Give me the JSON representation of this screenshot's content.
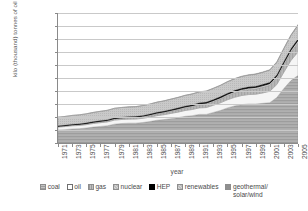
{
  "chart_data": {
    "type": "area",
    "stacked": true,
    "title": "",
    "xlabel": "year",
    "ylabel": "kilo (thousand) tonnes of oil equivalent (ktoe)",
    "ylim": [
      0,
      2000000
    ],
    "ytick_labels": [
      "0",
      "200,000",
      "400,000",
      "600,000",
      "800,000",
      "1,000,000",
      "1,200,000",
      "1,400,000",
      "1,600,000",
      "1,800,000",
      "2,000,000"
    ],
    "ytick_values": [
      0,
      200000,
      400000,
      600000,
      800000,
      1000000,
      1200000,
      1400000,
      1600000,
      1800000,
      2000000
    ],
    "xlim": [
      1971,
      2005
    ],
    "xtick_labels": [
      "1971",
      "1973",
      "1975",
      "1977",
      "1979",
      "1981",
      "1983",
      "1985",
      "1987",
      "1989",
      "1991",
      "1993",
      "1995",
      "1997",
      "1999",
      "2001",
      "2003",
      "2005"
    ],
    "xtick_values": [
      1971,
      1973,
      1975,
      1977,
      1979,
      1981,
      1983,
      1985,
      1987,
      1989,
      1991,
      1993,
      1995,
      1997,
      1999,
      2001,
      2003,
      2005
    ],
    "grid": true,
    "legend_position": "bottom",
    "x": [
      1971,
      1972,
      1973,
      1974,
      1975,
      1976,
      1977,
      1978,
      1979,
      1980,
      1981,
      1982,
      1983,
      1984,
      1985,
      1986,
      1987,
      1988,
      1989,
      1990,
      1991,
      1992,
      1993,
      1994,
      1995,
      1996,
      1997,
      1998,
      1999,
      2000,
      2001,
      2002,
      2003,
      2004,
      2005
    ],
    "series": [
      {
        "name": "coal",
        "color": "#a8a8a8",
        "values": [
          200000,
          205000,
          215000,
          220000,
          230000,
          245000,
          255000,
          265000,
          290000,
          300000,
          305000,
          305000,
          315000,
          330000,
          350000,
          360000,
          375000,
          390000,
          410000,
          420000,
          440000,
          440000,
          470000,
          500000,
          540000,
          570000,
          590000,
          600000,
          600000,
          610000,
          620000,
          700000,
          840000,
          960000,
          1040000
        ]
      },
      {
        "name": "oil",
        "color": "#f2f2f2",
        "values": [
          45000,
          48000,
          50000,
          50000,
          52000,
          55000,
          58000,
          60000,
          62000,
          62000,
          62000,
          63000,
          65000,
          68000,
          70000,
          75000,
          80000,
          85000,
          90000,
          95000,
          100000,
          105000,
          110000,
          118000,
          125000,
          132000,
          140000,
          145000,
          150000,
          160000,
          175000,
          200000,
          250000,
          310000,
          360000
        ]
      },
      {
        "name": "gas",
        "color": "#bdbdbd",
        "values": [
          12000,
          13000,
          14000,
          15000,
          16000,
          17000,
          18000,
          19000,
          20000,
          21000,
          22000,
          23000,
          25000,
          27000,
          29000,
          31000,
          34000,
          37000,
          40000,
          43000,
          46000,
          50000,
          54000,
          58000,
          63000,
          68000,
          72000,
          76000,
          80000,
          86000,
          92000,
          100000,
          112000,
          125000,
          140000
        ]
      },
      {
        "name": "nuclear",
        "color": "#d4d4d4",
        "values": [
          2000,
          2200,
          2500,
          3000,
          3500,
          4000,
          4500,
          5000,
          5500,
          6000,
          7000,
          8000,
          9000,
          10000,
          12000,
          13000,
          14000,
          15000,
          16000,
          17000,
          18000,
          19000,
          20000,
          21000,
          22000,
          23000,
          24000,
          25000,
          26000,
          27000,
          28000,
          30000,
          33000,
          36000,
          40000
        ]
      },
      {
        "name": "HEP",
        "color": "#000000",
        "values": [
          8000,
          8200,
          8500,
          8800,
          9000,
          9200,
          9500,
          9800,
          10000,
          10200,
          10500,
          10800,
          11000,
          11500,
          12000,
          12500,
          13000,
          13500,
          14000,
          14500,
          15000,
          15500,
          16000,
          16500,
          17000,
          17500,
          18000,
          18500,
          19000,
          19500,
          20000,
          21000,
          22000,
          23000,
          24000
        ]
      },
      {
        "name": "renewables",
        "color": "#c4c4c4",
        "values": [
          130000,
          132000,
          134000,
          136000,
          138000,
          140000,
          142000,
          144000,
          146000,
          147000,
          148000,
          149000,
          150000,
          152000,
          154000,
          156000,
          158000,
          160000,
          162000,
          164000,
          166000,
          168000,
          170000,
          172000,
          174000,
          176000,
          178000,
          180000,
          182000,
          184000,
          186000,
          190000,
          195000,
          200000,
          206000
        ]
      },
      {
        "name": "geothermal/solar/wind",
        "color": "#8f8f8f",
        "values": [
          800,
          850,
          900,
          950,
          1000,
          1100,
          1200,
          1300,
          1400,
          1500,
          1600,
          1700,
          1800,
          1900,
          2000,
          2200,
          2400,
          2600,
          2800,
          3000,
          3300,
          3600,
          4000,
          4400,
          4800,
          5200,
          5600,
          6000,
          6500,
          7000,
          7500,
          8500,
          9500,
          10500,
          12000
        ]
      }
    ],
    "totals": [
      397800,
      409250,
      424900,
      433750,
      446500,
      471300,
      489200,
      505100,
      534900,
      546700,
      556100,
      558500,
      576800,
      609400,
      649000,
      679700,
      716400,
      753100,
      794800,
      816500,
      850300,
      861100,
      904000,
      965900,
      1045800,
      1112700,
      1167600,
      1195500,
      1213500,
      1273500,
      1349500,
      1529500,
      1841500,
      2154500,
      2334000
    ]
  },
  "legend": {
    "items": [
      {
        "label": "coal",
        "pattern": "hatch-light",
        "color": "#b5b5b5"
      },
      {
        "label": "oil",
        "pattern": "solid",
        "color": "#ffffff"
      },
      {
        "label": "gas",
        "pattern": "hatch-medium",
        "color": "#a5a5a5"
      },
      {
        "label": "nuclear",
        "pattern": "hatch-fine",
        "color": "#c9c9c9"
      },
      {
        "label": "HEP",
        "pattern": "solid",
        "color": "#000000"
      },
      {
        "label": "renewables",
        "pattern": "hatch-fine",
        "color": "#cfcfcf"
      },
      {
        "label": "geothermal/",
        "label2": "solar/wind",
        "pattern": "solid",
        "color": "#8f8f8f"
      }
    ]
  }
}
